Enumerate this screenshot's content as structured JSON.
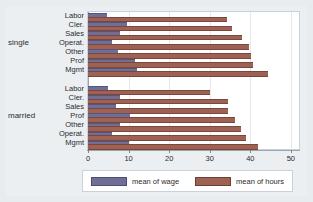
{
  "chart_data": {
    "type": "bar",
    "orientation": "horizontal",
    "title": "",
    "subtitle": "",
    "xlabel": "",
    "ylabel": "",
    "xlim": [
      0,
      52
    ],
    "xticks": [
      0,
      10,
      20,
      30,
      40,
      50
    ],
    "xticklabels": [
      "0",
      "10",
      "20",
      "30",
      "40",
      "50"
    ],
    "grid": true,
    "grid_axis": "x",
    "legend_position": "bottom",
    "colors": {
      "wage": "#6e6e96",
      "hours": "#9d6253",
      "background": "#e8ecef",
      "plot_background": "#ffffff",
      "gridline": "#e3e8ec",
      "axis": "#9aa6ae"
    },
    "series": [
      {
        "name": "mean of wage",
        "key": "wage"
      },
      {
        "name": "mean of hours",
        "key": "hours"
      }
    ],
    "groups": [
      {
        "label": "single",
        "categories": [
          {
            "label": "Labor",
            "wage": 4.6,
            "hours": 34.2
          },
          {
            "label": "Cler.",
            "wage": 9.6,
            "hours": 35.5
          },
          {
            "label": "Sales",
            "wage": 7.9,
            "hours": 37.9
          },
          {
            "label": "Operat.",
            "wage": 5.8,
            "hours": 39.8
          },
          {
            "label": "Other",
            "wage": 7.3,
            "hours": 40.2
          },
          {
            "label": "Prof",
            "wage": 11.5,
            "hours": 40.6
          },
          {
            "label": "Mgmt",
            "wage": 12.0,
            "hours": 44.4
          }
        ]
      },
      {
        "label": "married",
        "categories": [
          {
            "label": "Labor",
            "wage": 5.0,
            "hours": 30.0
          },
          {
            "label": "Cler.",
            "wage": 8.0,
            "hours": 34.5
          },
          {
            "label": "Sales",
            "wage": 7.0,
            "hours": 34.6
          },
          {
            "label": "Prof",
            "wage": 10.4,
            "hours": 36.2
          },
          {
            "label": "Other",
            "wage": 7.8,
            "hours": 37.8
          },
          {
            "label": "Operat.",
            "wage": 5.8,
            "hours": 38.9
          },
          {
            "label": "Mgmt",
            "wage": 10.2,
            "hours": 42.0
          }
        ]
      }
    ]
  },
  "legend": {
    "entries": [
      {
        "label": "mean of wage",
        "color_key": "wage"
      },
      {
        "label": "mean of hours",
        "color_key": "hours"
      }
    ]
  }
}
